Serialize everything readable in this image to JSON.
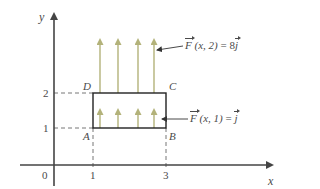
{
  "axes": {
    "x_label": "x",
    "y_label": "y",
    "origin_label": "0",
    "x_ticks": [
      "1",
      "3"
    ],
    "y_ticks": [
      "1",
      "2"
    ]
  },
  "rectangle": {
    "corners": {
      "A": "A",
      "B": "B",
      "C": "C",
      "D": "D"
    },
    "x_range": [
      1,
      3
    ],
    "y_range": [
      1,
      2
    ]
  },
  "vectors": {
    "top": {
      "name": "F",
      "args": "(x, 2)",
      "equals": "=",
      "value_coeff": "8",
      "value_unit": "j",
      "count": 4,
      "color": "#b3b27a"
    },
    "bottom": {
      "name": "F",
      "args": "(x, 1)",
      "equals": "=",
      "value_coeff": "",
      "value_unit": "j",
      "count": 4,
      "color": "#b3b27a"
    }
  },
  "colors": {
    "axis": "#444444",
    "rectangle": "#222222",
    "dashed": "#666666",
    "arrow": "#b3b27a"
  }
}
